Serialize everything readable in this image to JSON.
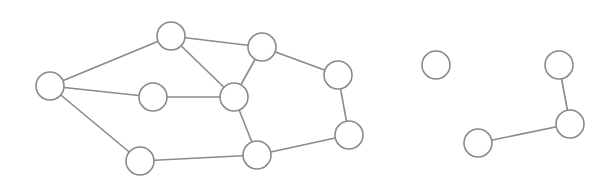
{
  "diagram": {
    "type": "undirected-graph",
    "style": {
      "node_stroke": "#8a8a8a",
      "node_fill": "#ffffff",
      "edge_stroke": "#8a8a8a",
      "node_radius": 14
    },
    "nodes": [
      {
        "id": "n1",
        "x": 50,
        "y": 86
      },
      {
        "id": "n2",
        "x": 171,
        "y": 36
      },
      {
        "id": "n3",
        "x": 262,
        "y": 47
      },
      {
        "id": "n4",
        "x": 153,
        "y": 97
      },
      {
        "id": "n5",
        "x": 234,
        "y": 97
      },
      {
        "id": "n6",
        "x": 338,
        "y": 75
      },
      {
        "id": "n7",
        "x": 349,
        "y": 135
      },
      {
        "id": "n8",
        "x": 140,
        "y": 161
      },
      {
        "id": "n9",
        "x": 257,
        "y": 155
      },
      {
        "id": "n10",
        "x": 436,
        "y": 65
      },
      {
        "id": "n11",
        "x": 559,
        "y": 65
      },
      {
        "id": "n12",
        "x": 570,
        "y": 124
      },
      {
        "id": "n13",
        "x": 478,
        "y": 143
      }
    ],
    "edges": [
      [
        "n1",
        "n2"
      ],
      [
        "n1",
        "n4"
      ],
      [
        "n1",
        "n8"
      ],
      [
        "n2",
        "n3"
      ],
      [
        "n2",
        "n5"
      ],
      [
        "n4",
        "n5"
      ],
      [
        "n3",
        "n5"
      ],
      [
        "n3",
        "n6"
      ],
      [
        "n5",
        "n9"
      ],
      [
        "n8",
        "n9"
      ],
      [
        "n9",
        "n7"
      ],
      [
        "n6",
        "n7"
      ],
      [
        "n11",
        "n12"
      ],
      [
        "n12",
        "n13"
      ]
    ],
    "components": [
      [
        "n1",
        "n2",
        "n3",
        "n4",
        "n5",
        "n6",
        "n7",
        "n8",
        "n9"
      ],
      [
        "n10"
      ],
      [
        "n11",
        "n12",
        "n13"
      ]
    ]
  }
}
